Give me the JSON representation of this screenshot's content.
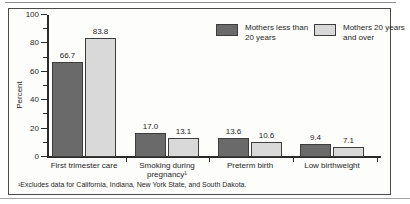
{
  "colors": {
    "dark": "#6a6a6a",
    "light": "#d9d9d9",
    "axis": "#2a2a2a",
    "edge": "#3d3d3d",
    "text": "#1f1f1f"
  },
  "legend": [
    {
      "label": "Mothers less than\n20 years",
      "swatch": "dark"
    },
    {
      "label": "Mothers 20 years\nand over",
      "swatch": "light"
    }
  ],
  "chart_data": {
    "type": "bar",
    "categories": [
      "First trimester care",
      "Smoking during\npregnancy¹",
      "Preterm birth",
      "Low birthweight"
    ],
    "series": [
      {
        "name": "Mothers less than 20 years",
        "values": [
          66.7,
          17.0,
          13.6,
          9.4
        ]
      },
      {
        "name": "Mothers 20 years and over",
        "values": [
          83.8,
          13.1,
          10.6,
          7.1
        ]
      }
    ],
    "title": "",
    "xlabel": "",
    "ylabel": "Percent",
    "ylim": [
      0,
      100
    ],
    "yticks": [
      0,
      20,
      40,
      60,
      80,
      100
    ],
    "yticks_minor": [
      10,
      30,
      50,
      70,
      90
    ],
    "grid": false,
    "legend_position": "top-right",
    "value_labels_shown": true
  },
  "footnote": "¹Excludes data for California, Indiana, New York State, and South Dakota."
}
